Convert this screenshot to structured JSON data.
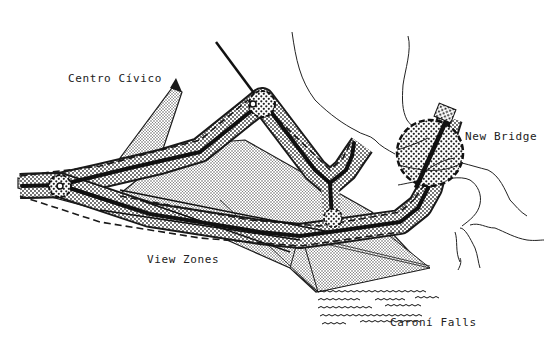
{
  "map": {
    "labels": {
      "centro_civico": "Centro Cívico",
      "new_bridge": "New Bridge",
      "view_zones": "View Zones",
      "caroni_falls": "Caroní Falls"
    },
    "colors": {
      "ink": "#1a1a1a",
      "paper": "#ffffff",
      "stipple": "#3a3a3a",
      "label": "#222222"
    }
  }
}
